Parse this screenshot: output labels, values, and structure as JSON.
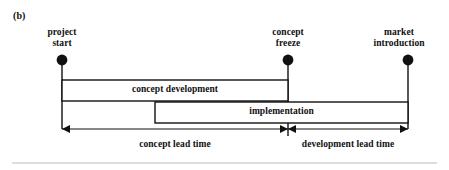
{
  "figure": {
    "enumeration": "(b)",
    "milestones": [
      {
        "id": "project-start",
        "label": "project\nstart",
        "x": 62,
        "dot_y": 60
      },
      {
        "id": "concept-freeze",
        "label": "concept\nfreeze",
        "x": 288,
        "dot_y": 60
      },
      {
        "id": "market-introduction",
        "label": "market\nintroduction",
        "x": 408,
        "dot_y": 60
      }
    ],
    "phases": [
      {
        "id": "concept-development",
        "label": "concept development",
        "start_x": 62,
        "end_x": 288,
        "top_y": 80,
        "bottom_y": 101
      },
      {
        "id": "implementation",
        "label": "implementation",
        "start_x": 155,
        "end_x": 408,
        "top_y": 102,
        "bottom_y": 123
      }
    ],
    "spans": [
      {
        "id": "concept-lead-time",
        "label": "concept lead time",
        "start_x": 62,
        "end_x": 288
      },
      {
        "id": "development-lead-time",
        "label": "development lead time",
        "start_x": 288,
        "end_x": 408
      }
    ],
    "axis_y": 129,
    "colors": {
      "ink": "#111111",
      "bar_fill": "#ffffff",
      "rule": "#bbbbbb"
    }
  }
}
